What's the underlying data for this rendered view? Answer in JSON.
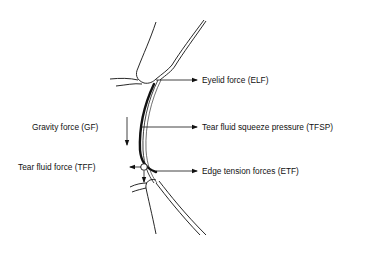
{
  "diagram": {
    "type": "force diagram",
    "colors": {
      "ink": "#111111",
      "background": "#ffffff"
    },
    "labels": {
      "elf": "Eyelid force (ELF)",
      "gf": "Gravity force (GF)",
      "tfsp": "Tear fluid squeeze pressure (TFSP)",
      "tff": "Tear fluid force (TFF)",
      "etf": "Edge tension forces (ETF)"
    },
    "forces": [
      {
        "id": "ELF",
        "name": "Eyelid force",
        "direction": "right"
      },
      {
        "id": "GF",
        "name": "Gravity force",
        "direction": "down"
      },
      {
        "id": "TFSP",
        "name": "Tear fluid squeeze pressure",
        "direction": "right"
      },
      {
        "id": "TFF",
        "name": "Tear fluid force",
        "direction": "left"
      },
      {
        "id": "ETF",
        "name": "Edge tension forces",
        "direction": "right"
      }
    ]
  }
}
